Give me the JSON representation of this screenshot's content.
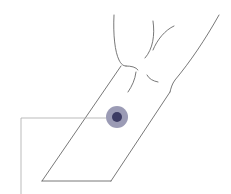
{
  "diagram": {
    "colors": {
      "background": "#ffffff",
      "outline": "#555555",
      "leader_line": "#aaaaaa",
      "marker_outer": "#8a89a8",
      "marker_inner": "#3c3b63"
    },
    "marker": {
      "cx": 117,
      "cy": 117,
      "outer_r": 11,
      "inner_r": 5
    },
    "leader": {
      "x": 21,
      "y_top": 118,
      "y_bottom": 194,
      "x_end": 106
    }
  }
}
